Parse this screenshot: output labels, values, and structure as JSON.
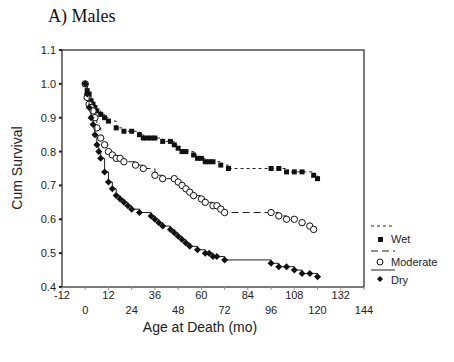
{
  "chart_data": {
    "type": "line",
    "title": "A) Males",
    "xlabel": "Age at Death (mo)",
    "ylabel": "Cum Survival",
    "xlim": [
      -12,
      144
    ],
    "ylim": [
      0.4,
      1.1
    ],
    "xticks": [
      -12,
      0,
      12,
      24,
      36,
      48,
      60,
      72,
      84,
      96,
      108,
      120,
      132,
      144
    ],
    "yticks": [
      "0.4",
      "0.5",
      "0.6",
      "0.7",
      "0.8",
      "0.9",
      "1.0",
      "1.1"
    ],
    "grid": false,
    "legend_position": "right",
    "series": [
      {
        "name": "Wet",
        "marker": "square",
        "line": "dotted",
        "x": [
          0,
          1,
          2,
          3,
          4,
          5,
          6,
          8,
          10,
          12,
          16,
          20,
          24,
          28,
          30,
          32,
          34,
          36,
          40,
          44,
          46,
          48,
          50,
          52,
          56,
          58,
          60,
          62,
          64,
          66,
          70,
          74,
          96,
          100,
          104,
          108,
          112,
          118,
          120
        ],
        "y": [
          1.0,
          0.98,
          0.97,
          0.95,
          0.94,
          0.93,
          0.92,
          0.91,
          0.9,
          0.89,
          0.87,
          0.86,
          0.86,
          0.85,
          0.84,
          0.84,
          0.84,
          0.84,
          0.83,
          0.83,
          0.82,
          0.81,
          0.8,
          0.8,
          0.79,
          0.78,
          0.78,
          0.77,
          0.77,
          0.77,
          0.76,
          0.75,
          0.75,
          0.75,
          0.74,
          0.74,
          0.74,
          0.73,
          0.72
        ]
      },
      {
        "name": "Moderate",
        "marker": "circle-open",
        "line": "dashed",
        "x": [
          0,
          1,
          2,
          3,
          4,
          5,
          6,
          8,
          10,
          12,
          14,
          16,
          18,
          20,
          26,
          30,
          36,
          40,
          46,
          48,
          50,
          52,
          54,
          56,
          60,
          62,
          66,
          68,
          70,
          72,
          96,
          100,
          104,
          108,
          112,
          116,
          118
        ],
        "y": [
          1.0,
          0.96,
          0.94,
          0.93,
          0.92,
          0.9,
          0.87,
          0.84,
          0.82,
          0.8,
          0.79,
          0.78,
          0.78,
          0.77,
          0.76,
          0.75,
          0.73,
          0.72,
          0.72,
          0.71,
          0.7,
          0.69,
          0.68,
          0.67,
          0.66,
          0.65,
          0.64,
          0.64,
          0.63,
          0.62,
          0.62,
          0.61,
          0.6,
          0.6,
          0.59,
          0.58,
          0.57
        ]
      },
      {
        "name": "Dry",
        "marker": "diamond",
        "line": "solid",
        "x": [
          0,
          1,
          2,
          3,
          4,
          5,
          6,
          7,
          8,
          10,
          12,
          14,
          16,
          18,
          20,
          22,
          24,
          28,
          34,
          36,
          38,
          40,
          44,
          46,
          48,
          50,
          52,
          54,
          58,
          62,
          64,
          66,
          68,
          72,
          96,
          100,
          104,
          108,
          112,
          116,
          120
        ],
        "y": [
          1.0,
          0.97,
          0.93,
          0.9,
          0.88,
          0.85,
          0.82,
          0.8,
          0.78,
          0.74,
          0.71,
          0.69,
          0.67,
          0.66,
          0.65,
          0.64,
          0.63,
          0.62,
          0.61,
          0.6,
          0.59,
          0.58,
          0.57,
          0.56,
          0.55,
          0.54,
          0.53,
          0.52,
          0.51,
          0.5,
          0.5,
          0.49,
          0.49,
          0.48,
          0.47,
          0.46,
          0.46,
          0.45,
          0.44,
          0.44,
          0.43
        ]
      }
    ]
  },
  "labels": {
    "title": "A) Males",
    "xlabel": "Age at Death (mo)",
    "ylabel": "Cum Survival",
    "legend": [
      "Wet",
      "Moderate",
      "Dry"
    ]
  }
}
